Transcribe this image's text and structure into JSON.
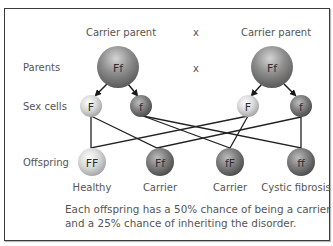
{
  "diagram": {
    "title_left": "Carrier parent",
    "title_right": "Carrier parent",
    "cross_symbol_top": "x",
    "cross_symbol_mid": "x",
    "row_labels": {
      "parents": "Parents",
      "sex_cells": "Sex cells",
      "offspring": "Offspring"
    },
    "parents": [
      {
        "genotype": "Ff",
        "cx": 118,
        "cy": 67,
        "r": 21
      },
      {
        "genotype": "Ff",
        "cx": 272,
        "cy": 67,
        "r": 21
      }
    ],
    "sex_cells": [
      {
        "allele": "F",
        "cx": 91,
        "cy": 106,
        "r": 11,
        "shade": "light"
      },
      {
        "allele": "f",
        "cx": 141,
        "cy": 106,
        "r": 11,
        "shade": "dark"
      },
      {
        "allele": "F",
        "cx": 248,
        "cy": 106,
        "r": 11,
        "shade": "light"
      },
      {
        "allele": "f",
        "cx": 301,
        "cy": 106,
        "r": 11,
        "shade": "dark"
      }
    ],
    "offspring": [
      {
        "genotype": "FF",
        "label": "Healthy",
        "cx": 92,
        "cy": 162,
        "shade": "light"
      },
      {
        "genotype": "Ff",
        "label": "Carrier",
        "cx": 160,
        "cy": 162,
        "shade": "dark"
      },
      {
        "genotype": "fF",
        "label": "Carrier",
        "cx": 230,
        "cy": 162,
        "shade": "dark"
      },
      {
        "genotype": "ff",
        "label": "Cystic fibrosis",
        "cx": 301,
        "cy": 162,
        "shade": "dark"
      }
    ],
    "caption_line1": "Each offspring has a 50% chance of being a carrier",
    "caption_line2": "and a 25% chance of inheriting the disorder.",
    "colors": {
      "frame": "#3a3a3a",
      "label_text": "#555555",
      "line": "#222222",
      "light_sphere": "#d8d8d8",
      "dark_sphere": "#7a7a7a"
    }
  }
}
